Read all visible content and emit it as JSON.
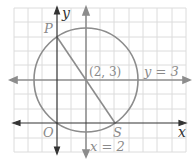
{
  "diagram": {
    "type": "coordinate-plane",
    "grid": {
      "unit_px": 14.4,
      "origin_px": [
        57,
        123
      ],
      "x_range": [
        -3,
        9
      ],
      "y_range": [
        -2,
        8
      ]
    },
    "axes": {
      "x_label": "x",
      "y_label": "y",
      "origin_label": "O"
    },
    "circle": {
      "center": [
        2,
        3
      ],
      "center_label": "(2, 3)",
      "radius": 3.606
    },
    "lines": [
      {
        "label": "y = 3",
        "type": "horizontal",
        "value": 3
      },
      {
        "label": "x = 2",
        "type": "vertical",
        "value": 2
      }
    ],
    "points": [
      {
        "label": "P",
        "coords": [
          0,
          6
        ]
      },
      {
        "label": "S",
        "coords": [
          4,
          0
        ]
      },
      {
        "label": "O",
        "coords": [
          0,
          0
        ]
      }
    ],
    "segment": {
      "from": "P",
      "to": "S"
    },
    "colors": {
      "grid": "#d9d9d9",
      "curve": "#8c8c8c",
      "axis": "#333333",
      "label": "#8a8a8a"
    }
  }
}
